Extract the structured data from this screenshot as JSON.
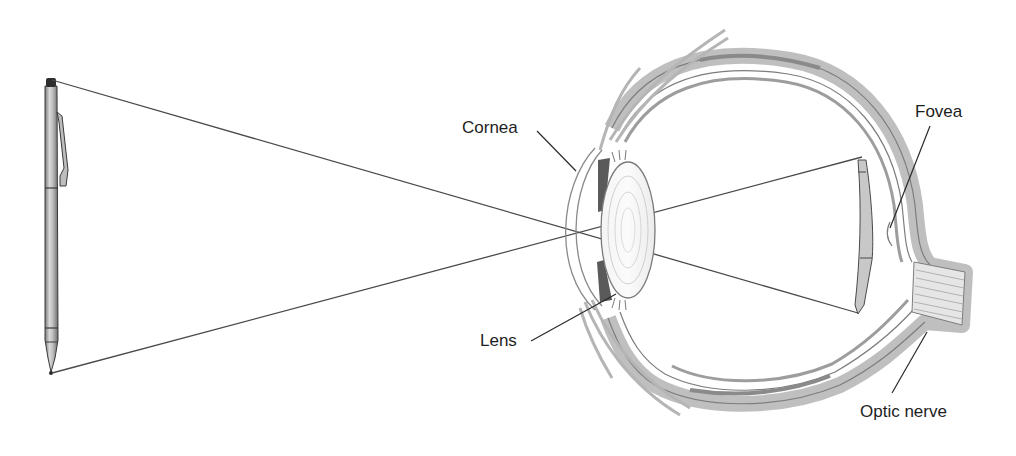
{
  "diagram": {
    "object": "pen",
    "labels": {
      "cornea": "Cornea",
      "lens": "Lens",
      "fovea": "Fovea",
      "optic_nerve": "Optic nerve"
    }
  },
  "colors": {
    "background": "#ffffff",
    "line": "#3a3a3a",
    "sclera_fill": "#c9c9c9",
    "sclera_dark": "#8a8a8a",
    "iris": "#5a5a5a",
    "label_text": "#1e1e1e"
  }
}
